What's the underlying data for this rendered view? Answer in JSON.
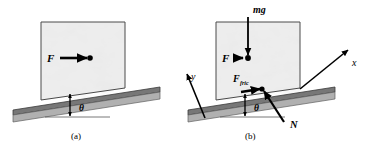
{
  "figure": {
    "type": "physics-free-body-diagram",
    "background_color": "#ffffff",
    "ink_color": "#000000",
    "incline_fill": "#a8a8a8",
    "incline_top_fill": "#6f6f6f",
    "block_fill": "#e8e8e8"
  },
  "panels": [
    {
      "id": "a",
      "caption": "(a)",
      "angle_label": "θ",
      "forces": [
        {
          "name": "applied-force",
          "label": "F",
          "direction": "horizontal-right"
        }
      ]
    },
    {
      "id": "b",
      "caption": "(b)",
      "angle_label": "θ",
      "forces": [
        {
          "name": "weight",
          "label": "mg",
          "direction": "vertical-down"
        },
        {
          "name": "applied-force",
          "label": "F",
          "direction": "horizontal-right"
        },
        {
          "name": "friction-force",
          "label": "F",
          "subscript": "fric",
          "direction": "up-the-incline"
        },
        {
          "name": "normal-force",
          "label": "N",
          "direction": "perpendicular-to-incline"
        }
      ],
      "axes": [
        {
          "name": "x-axis",
          "label": "x",
          "direction": "up-the-incline"
        },
        {
          "name": "y-axis",
          "label": "y",
          "direction": "perpendicular-to-incline"
        }
      ]
    }
  ]
}
